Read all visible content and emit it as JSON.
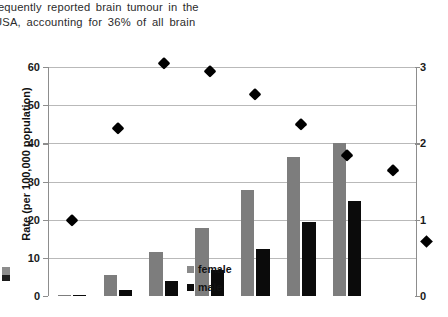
{
  "prose": {
    "line1": "requently  reported  brain  tumour  in  the",
    "line2": "USA,  accounting  for  36%  of  all  brain"
  },
  "legend": {
    "female_label": "female",
    "male_label": "male"
  },
  "colors": {
    "female_bar": "#7d7d7d",
    "male_bar": "#0b0b0b",
    "ratio_marker": "#000000",
    "gridline": "#b9b9b9",
    "axis": "#8d8d8d"
  },
  "chart_data": {
    "type": "bar",
    "title": "",
    "subtitle": "",
    "xlabel": "",
    "ylabel": "Rate (per 100,000 population)",
    "y2label": "Ratio of rate (female:male)",
    "ylim": [
      0,
      60
    ],
    "y2lim": [
      0,
      3
    ],
    "yticks": [
      0,
      10,
      20,
      30,
      40,
      50,
      60
    ],
    "y2ticks": [
      0,
      1,
      2,
      3
    ],
    "ytick_labels": [
      "0",
      "10",
      "20",
      "30",
      "40",
      "50",
      "60"
    ],
    "y2tick_labels": [
      "0",
      "1",
      "2",
      "3"
    ],
    "grid": true,
    "legend_position": "inside-center-left",
    "categories": [
      "0-19",
      "20-34",
      "35-44",
      "45-54",
      "55-64",
      "65-74",
      "75-84",
      "85+"
    ],
    "series": [
      {
        "name": "female",
        "kind": "bar",
        "axis": "left",
        "color": "#7d7d7d",
        "values": [
          0.1,
          5.5,
          11.5,
          17.8,
          27.8,
          36.3,
          40.0,
          0
        ]
      },
      {
        "name": "male",
        "kind": "bar",
        "axis": "left",
        "color": "#0b0b0b",
        "values": [
          0.05,
          1.5,
          4.0,
          6.8,
          12.3,
          19.5,
          25.0,
          0
        ]
      },
      {
        "name": "ratio (female:male)",
        "kind": "scatter",
        "axis": "right",
        "marker": "diamond",
        "color": "#000000",
        "values": [
          1.0,
          2.2,
          3.05,
          2.95,
          2.65,
          2.25,
          1.85,
          1.65
        ]
      }
    ]
  }
}
